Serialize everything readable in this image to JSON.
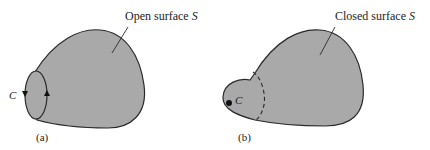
{
  "figure_a": {
    "caption": "(a)",
    "surface_label": "Open surface",
    "surface_symbol": "S",
    "curve_label": "C"
  },
  "figure_b": {
    "caption": "(b)",
    "surface_label": "Closed surface",
    "surface_symbol": "S",
    "curve_label": "C"
  },
  "colors": {
    "surface_fill": "#a9a9a9",
    "outline": "#2a2a2a",
    "background": "#ffffff"
  }
}
